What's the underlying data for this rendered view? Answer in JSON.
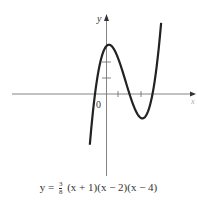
{
  "chart_data": {
    "type": "line",
    "title": "",
    "equation": "y = 3/8 (x + 1)(x - 2)(x - 4)",
    "xlabel": "x",
    "ylabel": "y",
    "origin_label": "0",
    "x_ticks": [
      1,
      3
    ],
    "y_ticks": [
      1,
      2
    ],
    "x_roots": [
      -1,
      2,
      4
    ],
    "y_intercept": 3,
    "local_max": {
      "x": 0.0,
      "y": 3.0
    },
    "local_min": {
      "x": 3.0,
      "y": -1.5
    },
    "grid": false,
    "series": [
      {
        "name": "y = 3/8 (x+1)(x-2)(x-4)",
        "x": [
          -1.4,
          -1.0,
          -0.5,
          0,
          0.5,
          1,
          1.5,
          2,
          2.5,
          3,
          3.5,
          4,
          4.5
        ],
        "y": [
          -6.92,
          0,
          2.3,
          3.0,
          2.58,
          1.5,
          0.23,
          0,
          -0.98,
          -1.5,
          -1.27,
          0,
          2.53
        ]
      }
    ],
    "line_color": "#222222"
  },
  "labels": {
    "y_axis": "y",
    "x_axis": "x",
    "origin": "0",
    "caption_prefix": "y =",
    "caption_frac_num": "3",
    "caption_frac_den": "8",
    "caption_rest": "(x + 1)(x − 2)(x − 4)"
  }
}
